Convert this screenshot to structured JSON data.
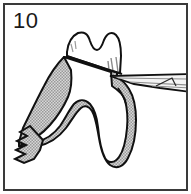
{
  "figure": {
    "number_label": "10",
    "border_color": "#3a3a3a",
    "background_color": "#ffffff"
  },
  "parts": {
    "crown": {
      "name": "Tooth crown",
      "fill": "#ffffff",
      "stroke": "#111111"
    },
    "root_mass": {
      "name": "Root and bone mass",
      "fill": "#b8b8b8",
      "stroke": "#111111",
      "pattern": "stipple"
    },
    "instrument": {
      "name": "Dental elevator",
      "fill": "#f2f2f2",
      "stroke": "#111111"
    },
    "cut_edge": {
      "name": "Jagged cut bone margin",
      "stroke": "#111111"
    }
  },
  "icons": {
    "figure_number": "number-label",
    "instrument": "elevator-instrument-icon",
    "tooth": "tooth-icon"
  }
}
